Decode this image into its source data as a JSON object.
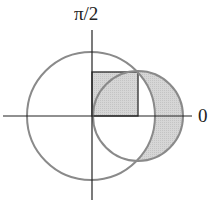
{
  "diagram": {
    "type": "polar-regions",
    "labels": {
      "pole_axis": "π/2",
      "polar_axis": "0"
    },
    "axes": {
      "origin": [
        92,
        116
      ],
      "horizontal": {
        "x1": 3,
        "x2": 192
      },
      "vertical": {
        "y1": 20,
        "y2": 200
      }
    },
    "shapes": [
      {
        "name": "large-circle",
        "cx": 91,
        "cy": 116,
        "r": 64,
        "stroke": "#8a8a8a"
      },
      {
        "name": "small-circle",
        "cx": 138,
        "cy": 116,
        "r": 45,
        "stroke": "#8a8a8a"
      },
      {
        "name": "rectangle",
        "x": 92,
        "y": 72,
        "width": 46,
        "height": 44,
        "stroke": "#222222",
        "fill": "#d4d4d4"
      },
      {
        "name": "crescent-region",
        "fill": "#d4d4d4",
        "description": "part of small circle outside large circle"
      }
    ],
    "colors": {
      "shade": "#d4d4d4",
      "circle_stroke": "#8a8a8a",
      "axis": "#222222"
    }
  }
}
